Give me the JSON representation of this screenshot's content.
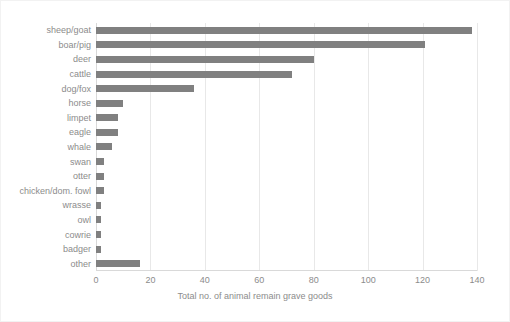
{
  "chart_data": {
    "type": "bar",
    "orientation": "horizontal",
    "title": "",
    "xlabel": "Total no. of animal remain grave goods",
    "ylabel": "",
    "xlim": [
      0,
      140
    ],
    "xticks": [
      0,
      20,
      40,
      60,
      80,
      100,
      120,
      140
    ],
    "grid": true,
    "legend": false,
    "bar_color": "#808080",
    "categories": [
      "sheep/goat",
      "boar/pig",
      "deer",
      "cattle",
      "dog/fox",
      "horse",
      "limpet",
      "eagle",
      "whale",
      "swan",
      "otter",
      "chicken/dom. fowl",
      "wrasse",
      "owl",
      "cowrie",
      "badger",
      "other"
    ],
    "values": [
      138,
      121,
      80,
      72,
      36,
      10,
      8,
      8,
      6,
      3,
      3,
      3,
      2,
      2,
      2,
      2,
      16
    ]
  }
}
